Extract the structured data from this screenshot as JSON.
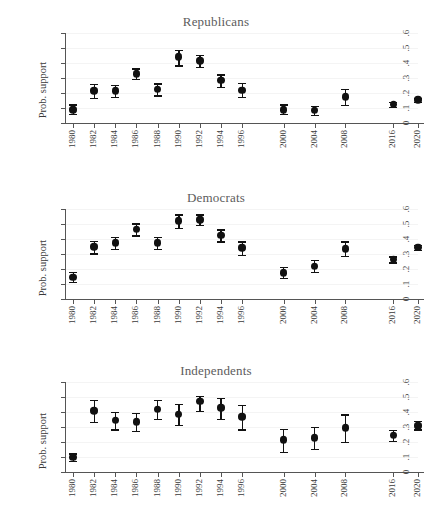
{
  "figure": {
    "corner_mark": "",
    "y_axis_title": "Prob. support",
    "y_ticks": [
      "0",
      ".1",
      ".2",
      ".3",
      ".4",
      ".5",
      ".6"
    ],
    "x_ticks": [
      "1980",
      "1982",
      "1984",
      "1986",
      "1988",
      "1990",
      "1992",
      "1994",
      "1996",
      "2000",
      "2004",
      "2008",
      "2016",
      "2020"
    ],
    "marker_color": "#111111"
  },
  "chart_data": [
    {
      "type": "scatter",
      "title": "Republicans",
      "xlabel": "",
      "ylabel": "Prob. support",
      "ylim": [
        0,
        0.6
      ],
      "grid": true,
      "legend": "none",
      "categories": [
        "1980",
        "1982",
        "1984",
        "1986",
        "1988",
        "1990",
        "1992",
        "1994",
        "1996",
        "2000",
        "2004",
        "2008",
        "2016",
        "2020"
      ],
      "values": [
        0.09,
        0.215,
        0.215,
        0.33,
        0.225,
        0.44,
        0.415,
        0.285,
        0.22,
        0.09,
        0.085,
        0.175,
        0.125,
        0.155
      ],
      "ci_low": [
        0.06,
        0.17,
        0.175,
        0.295,
        0.185,
        0.385,
        0.375,
        0.24,
        0.175,
        0.06,
        0.055,
        0.12,
        0.11,
        0.14
      ],
      "ci_high": [
        0.125,
        0.26,
        0.255,
        0.365,
        0.265,
        0.49,
        0.455,
        0.325,
        0.27,
        0.125,
        0.115,
        0.23,
        0.14,
        0.17
      ]
    },
    {
      "type": "scatter",
      "title": "Democrats",
      "xlabel": "",
      "ylabel": "Prob. support",
      "ylim": [
        0,
        0.6
      ],
      "grid": true,
      "legend": "none",
      "categories": [
        "1980",
        "1982",
        "1984",
        "1986",
        "1988",
        "1990",
        "1992",
        "1994",
        "1996",
        "2000",
        "2004",
        "2008",
        "2016",
        "2020"
      ],
      "values": [
        0.145,
        0.35,
        0.375,
        0.465,
        0.375,
        0.52,
        0.53,
        0.425,
        0.34,
        0.175,
        0.22,
        0.335,
        0.265,
        0.345
      ],
      "ci_low": [
        0.115,
        0.305,
        0.335,
        0.425,
        0.335,
        0.475,
        0.495,
        0.385,
        0.295,
        0.14,
        0.18,
        0.29,
        0.245,
        0.33
      ],
      "ci_high": [
        0.18,
        0.39,
        0.415,
        0.505,
        0.415,
        0.565,
        0.565,
        0.465,
        0.385,
        0.215,
        0.26,
        0.385,
        0.285,
        0.36
      ]
    },
    {
      "type": "scatter",
      "title": "Independents",
      "xlabel": "",
      "ylabel": "Prob. support",
      "ylim": [
        0,
        0.6
      ],
      "grid": true,
      "legend": "none",
      "categories": [
        "1980",
        "1982",
        "1984",
        "1986",
        "1988",
        "1990",
        "1992",
        "1994",
        "1996",
        "2000",
        "2004",
        "2008",
        "2016",
        "2020"
      ],
      "values": [
        0.1,
        0.41,
        0.345,
        0.335,
        0.42,
        0.385,
        0.47,
        0.43,
        0.37,
        0.215,
        0.23,
        0.295,
        0.245,
        0.31
      ],
      "ci_low": [
        0.075,
        0.335,
        0.285,
        0.275,
        0.355,
        0.315,
        0.41,
        0.355,
        0.285,
        0.135,
        0.155,
        0.2,
        0.21,
        0.285
      ],
      "ci_high": [
        0.125,
        0.48,
        0.4,
        0.395,
        0.48,
        0.455,
        0.51,
        0.495,
        0.45,
        0.29,
        0.3,
        0.385,
        0.28,
        0.34
      ]
    }
  ]
}
